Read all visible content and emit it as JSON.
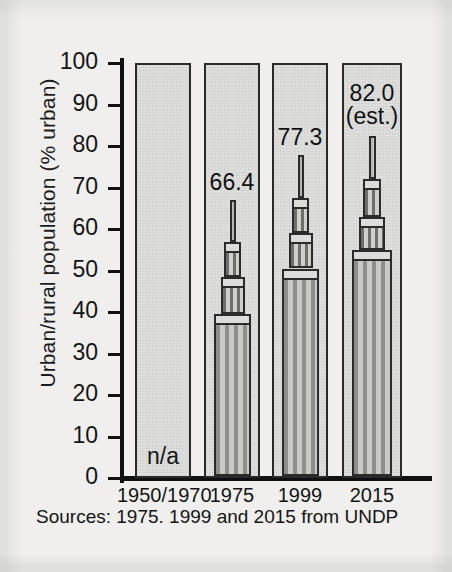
{
  "chart_data": {
    "type": "bar",
    "title": "",
    "xlabel": "",
    "ylabel": "Urban/rural population (% urban)",
    "ylim": [
      0,
      100
    ],
    "ytick_step": 10,
    "yticks": [
      100,
      90,
      80,
      70,
      60,
      50,
      40,
      30,
      20,
      10,
      0
    ],
    "grid": false,
    "legend": null,
    "categories": [
      "1950/1970",
      "1975",
      "1999",
      "2015"
    ],
    "values": [
      null,
      66.4,
      77.3,
      82.0
    ],
    "value_labels": [
      "n/a",
      "66.4",
      "77.3",
      "82.0"
    ],
    "annotations": [
      "(est.)"
    ],
    "bars": [
      {
        "category": "1950/1970",
        "value": null,
        "label": "n/a",
        "note": "",
        "available": false,
        "tiers": []
      },
      {
        "category": "1975",
        "value": 66.4,
        "label": "66.4",
        "note": "",
        "available": true,
        "tiers": [
          {
            "name": "base",
            "top": 39.0,
            "width_pct": 100
          },
          {
            "name": "tier-1",
            "top": 48.0,
            "width_pct": 66
          },
          {
            "name": "tier-2",
            "top": 56.5,
            "width_pct": 46
          },
          {
            "name": "spire",
            "top": 66.4,
            "width_pct": 17
          }
        ]
      },
      {
        "category": "1999",
        "value": 77.3,
        "label": "77.3",
        "note": "",
        "available": true,
        "tiers": [
          {
            "name": "base",
            "top": 50.0,
            "width_pct": 100
          },
          {
            "name": "tier-1",
            "top": 58.5,
            "width_pct": 66
          },
          {
            "name": "tier-2",
            "top": 67.0,
            "width_pct": 46
          },
          {
            "name": "spire",
            "top": 77.3,
            "width_pct": 17
          }
        ]
      },
      {
        "category": "2015",
        "value": 82.0,
        "label": "82.0",
        "note": "(est.)",
        "available": true,
        "tiers": [
          {
            "name": "base",
            "top": 54.5,
            "width_pct": 100
          },
          {
            "name": "tier-1",
            "top": 62.5,
            "width_pct": 66
          },
          {
            "name": "tier-2",
            "top": 71.5,
            "width_pct": 46
          },
          {
            "name": "spire",
            "top": 82.0,
            "width_pct": 17
          }
        ]
      }
    ],
    "source_note": "Sources: 1975. 1999 and 2015 from UNDP"
  },
  "colors": {
    "paper": "#f0efee",
    "panel_fill": "#dfdfdd",
    "panel_border": "#2a2a2a",
    "building_base": "#b9b9b6",
    "building_tier": "#c4c4c1",
    "building_spire": "#cfcfcc",
    "ink": "#111111"
  }
}
